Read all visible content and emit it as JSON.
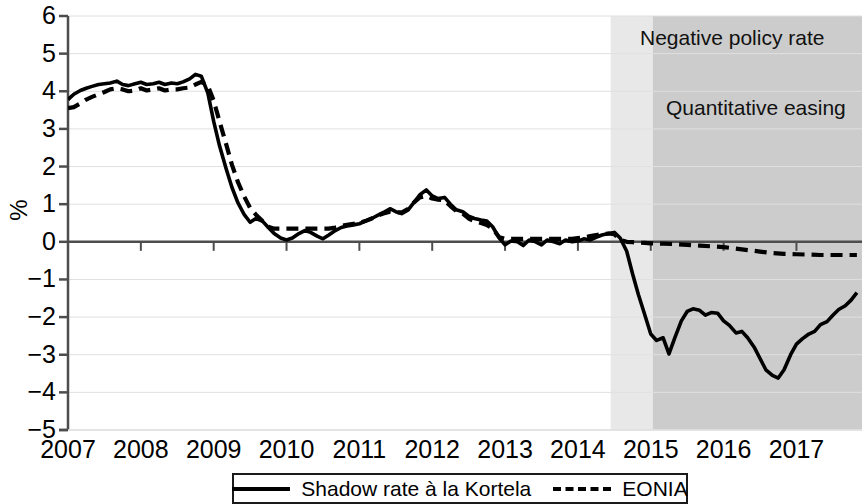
{
  "chart_data": {
    "type": "line",
    "title": "",
    "subtitle": "",
    "xlabel": "",
    "ylabel": "%",
    "xlim": [
      2007.0,
      2017.9
    ],
    "ylim": [
      -5,
      6
    ],
    "grid": true,
    "grid_axis": "y",
    "legend_position": "bottom-center",
    "y_ticks": [
      "6",
      "5",
      "4",
      "3",
      "2",
      "1",
      "0",
      "−1",
      "−2",
      "−3",
      "−4",
      "−5"
    ],
    "y_tick_values": [
      6,
      5,
      4,
      3,
      2,
      1,
      0,
      -1,
      -2,
      -3,
      -4,
      -5
    ],
    "x_ticks": [
      "2007",
      "2008",
      "2009",
      "2010",
      "2011",
      "2012",
      "2013",
      "2014",
      "2015",
      "2016",
      "2017"
    ],
    "x_tick_values": [
      2007,
      2008,
      2009,
      2010,
      2011,
      2012,
      2013,
      2014,
      2015,
      2016,
      2017
    ],
    "zero_line": 0,
    "shaded_regions": [
      {
        "label": "Negative policy rate",
        "x_start": 2014.45,
        "x_end": 2017.9,
        "color": "#e8e8e8",
        "annotation_text": "Negative policy rate"
      },
      {
        "label": "Quantitative easing",
        "x_start": 2015.03,
        "x_end": 2017.9,
        "color": "#cccccc",
        "annotation_text": "Quantitative easing"
      }
    ],
    "series": [
      {
        "name": "Shadow rate à la Kortela",
        "style": "solid",
        "color": "#000000",
        "x": [
          2007.0,
          2007.08,
          2007.17,
          2007.25,
          2007.33,
          2007.42,
          2007.5,
          2007.58,
          2007.67,
          2007.75,
          2007.83,
          2007.92,
          2008.0,
          2008.08,
          2008.17,
          2008.25,
          2008.33,
          2008.42,
          2008.5,
          2008.58,
          2008.67,
          2008.75,
          2008.83,
          2008.92,
          2009.0,
          2009.08,
          2009.17,
          2009.25,
          2009.33,
          2009.42,
          2009.5,
          2009.58,
          2009.67,
          2009.75,
          2009.83,
          2009.92,
          2010.0,
          2010.08,
          2010.17,
          2010.25,
          2010.33,
          2010.42,
          2010.5,
          2010.58,
          2010.67,
          2010.75,
          2010.83,
          2010.92,
          2011.0,
          2011.08,
          2011.17,
          2011.25,
          2011.33,
          2011.42,
          2011.5,
          2011.58,
          2011.67,
          2011.75,
          2011.83,
          2011.92,
          2012.0,
          2012.08,
          2012.17,
          2012.25,
          2012.33,
          2012.42,
          2012.5,
          2012.58,
          2012.67,
          2012.75,
          2012.83,
          2012.92,
          2013.0,
          2013.08,
          2013.17,
          2013.25,
          2013.33,
          2013.42,
          2013.5,
          2013.58,
          2013.67,
          2013.75,
          2013.83,
          2013.92,
          2014.0,
          2014.08,
          2014.17,
          2014.25,
          2014.33,
          2014.42,
          2014.5,
          2014.58,
          2014.67,
          2014.75,
          2014.83,
          2014.92,
          2015.0,
          2015.08,
          2015.17,
          2015.25,
          2015.33,
          2015.42,
          2015.5,
          2015.58,
          2015.67,
          2015.75,
          2015.83,
          2015.92,
          2016.0,
          2016.08,
          2016.17,
          2016.25,
          2016.33,
          2016.42,
          2016.5,
          2016.58,
          2016.67,
          2016.75,
          2016.83,
          2016.92,
          2017.0,
          2017.08,
          2017.17,
          2017.25,
          2017.33,
          2017.42,
          2017.5,
          2017.58,
          2017.67,
          2017.75,
          2017.83
        ],
        "y": [
          3.78,
          3.92,
          4.02,
          4.08,
          4.13,
          4.18,
          4.2,
          4.22,
          4.27,
          4.18,
          4.15,
          4.2,
          4.24,
          4.18,
          4.2,
          4.24,
          4.18,
          4.22,
          4.2,
          4.25,
          4.33,
          4.45,
          4.4,
          3.95,
          3.2,
          2.55,
          1.95,
          1.45,
          1.05,
          0.72,
          0.52,
          0.62,
          0.55,
          0.38,
          0.22,
          0.1,
          0.05,
          0.1,
          0.22,
          0.3,
          0.25,
          0.15,
          0.08,
          0.18,
          0.3,
          0.38,
          0.42,
          0.45,
          0.48,
          0.55,
          0.62,
          0.7,
          0.78,
          0.88,
          0.8,
          0.75,
          0.85,
          1.05,
          1.25,
          1.38,
          1.22,
          1.15,
          1.18,
          1.0,
          0.85,
          0.8,
          0.68,
          0.62,
          0.58,
          0.55,
          0.4,
          0.1,
          -0.08,
          0.02,
          0.0,
          -0.1,
          0.05,
          0.0,
          -0.08,
          0.05,
          0.0,
          -0.05,
          0.05,
          0.0,
          0.02,
          0.08,
          0.05,
          0.12,
          0.18,
          0.22,
          0.25,
          0.1,
          -0.25,
          -0.85,
          -1.4,
          -1.95,
          -2.45,
          -2.62,
          -2.55,
          -2.98,
          -2.55,
          -2.1,
          -1.85,
          -1.78,
          -1.82,
          -1.95,
          -1.88,
          -1.9,
          -2.1,
          -2.22,
          -2.42,
          -2.38,
          -2.55,
          -2.8,
          -3.1,
          -3.4,
          -3.55,
          -3.62,
          -3.4,
          -3.0,
          -2.72,
          -2.58,
          -2.45,
          -2.38,
          -2.2,
          -2.12,
          -1.95,
          -1.8,
          -1.7,
          -1.55,
          -1.35
        ]
      },
      {
        "name": "EONIA",
        "style": "dashed",
        "color": "#000000",
        "x": [
          2007.0,
          2007.08,
          2007.17,
          2007.25,
          2007.33,
          2007.42,
          2007.5,
          2007.58,
          2007.67,
          2007.75,
          2007.83,
          2007.92,
          2008.0,
          2008.08,
          2008.17,
          2008.25,
          2008.33,
          2008.42,
          2008.5,
          2008.58,
          2008.67,
          2008.75,
          2008.83,
          2008.92,
          2009.0,
          2009.08,
          2009.17,
          2009.25,
          2009.33,
          2009.42,
          2009.5,
          2009.58,
          2009.67,
          2009.75,
          2009.83,
          2009.92,
          2010.0,
          2010.08,
          2010.17,
          2010.25,
          2010.33,
          2010.42,
          2010.5,
          2010.58,
          2010.67,
          2010.75,
          2010.83,
          2010.92,
          2011.0,
          2011.08,
          2011.17,
          2011.25,
          2011.33,
          2011.42,
          2011.5,
          2011.58,
          2011.67,
          2011.75,
          2011.83,
          2011.92,
          2012.0,
          2012.08,
          2012.17,
          2012.25,
          2012.33,
          2012.42,
          2012.5,
          2012.58,
          2012.67,
          2012.75,
          2012.83,
          2012.92,
          2013.0,
          2013.08,
          2013.17,
          2013.25,
          2013.33,
          2013.42,
          2013.5,
          2013.58,
          2013.67,
          2013.75,
          2013.83,
          2013.92,
          2014.0,
          2014.08,
          2014.17,
          2014.25,
          2014.33,
          2014.42,
          2014.5,
          2014.58,
          2014.67,
          2014.75,
          2014.83,
          2014.92,
          2015.0,
          2015.17,
          2015.33,
          2015.5,
          2015.67,
          2015.83,
          2016.0,
          2016.17,
          2016.33,
          2016.5,
          2016.67,
          2016.83,
          2017.0,
          2017.17,
          2017.33,
          2017.5,
          2017.67,
          2017.83
        ],
        "y": [
          3.55,
          3.58,
          3.68,
          3.78,
          3.85,
          3.92,
          3.98,
          4.05,
          4.08,
          4.05,
          4.0,
          4.02,
          4.08,
          4.02,
          4.05,
          4.08,
          4.02,
          4.05,
          4.05,
          4.08,
          4.1,
          4.18,
          4.25,
          4.15,
          3.75,
          3.2,
          2.6,
          2.05,
          1.6,
          1.2,
          0.9,
          0.72,
          0.55,
          0.4,
          0.35,
          0.35,
          0.35,
          0.35,
          0.35,
          0.35,
          0.35,
          0.35,
          0.35,
          0.35,
          0.38,
          0.42,
          0.45,
          0.48,
          0.5,
          0.55,
          0.62,
          0.7,
          0.75,
          0.8,
          0.78,
          0.78,
          0.88,
          1.05,
          1.18,
          1.22,
          1.15,
          1.12,
          1.1,
          0.95,
          0.82,
          0.75,
          0.62,
          0.55,
          0.5,
          0.45,
          0.35,
          0.12,
          0.08,
          0.08,
          0.08,
          0.08,
          0.08,
          0.08,
          0.08,
          0.08,
          0.08,
          0.08,
          0.08,
          0.08,
          0.1,
          0.12,
          0.15,
          0.18,
          0.2,
          0.22,
          0.2,
          0.05,
          0.0,
          -0.01,
          -0.02,
          -0.03,
          -0.04,
          -0.05,
          -0.06,
          -0.08,
          -0.1,
          -0.12,
          -0.14,
          -0.18,
          -0.22,
          -0.26,
          -0.3,
          -0.32,
          -0.33,
          -0.34,
          -0.35,
          -0.35,
          -0.35,
          -0.35
        ]
      }
    ],
    "annotations": [
      {
        "text": "Negative policy rate",
        "x": 2015.0,
        "y": 5.2
      },
      {
        "text": "Quantitative easing",
        "x": 2015.2,
        "y": 3.4
      }
    ]
  },
  "axis": {
    "y_label": "%"
  },
  "legend": {
    "entries": [
      {
        "label": "Shadow rate à la Kortela",
        "style": "solid"
      },
      {
        "label": "EONIA",
        "style": "dashed"
      }
    ]
  },
  "colors": {
    "line": "#000000",
    "axis": "#4d4d4d",
    "grid": "#e0e0e0",
    "shade_light": "#e8e8e8",
    "shade_dark": "#cccccc",
    "background": "#ffffff"
  }
}
